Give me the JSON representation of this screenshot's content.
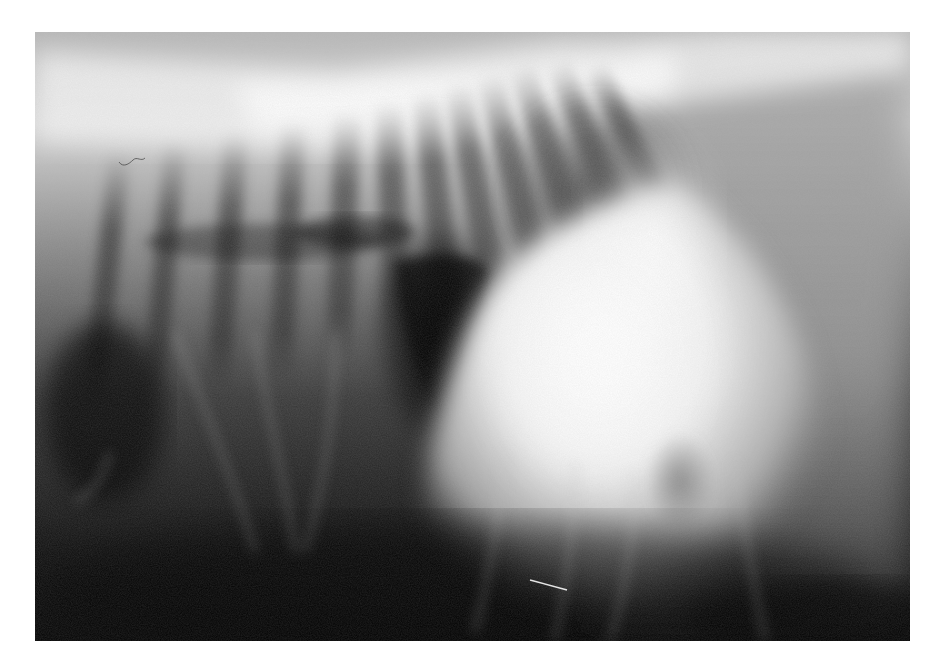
{
  "image": {
    "kind": "lateral thoracic radiograph",
    "palette": "grayscale",
    "frame": {
      "left": 35,
      "top": 32,
      "width": 875,
      "height": 609,
      "page_background": "#ffffff"
    },
    "regions": {
      "spine_band": {
        "tone": "#e8e8e8"
      },
      "lung_field": {
        "tone": "#3a3a3a"
      },
      "cardiac_silhouette": {
        "tone": "#f4f4f4"
      },
      "lower_abdomen": {
        "tone": "#0a0a0a"
      },
      "right_soft_tissue": {
        "tone": "#9a9a9a"
      }
    },
    "rib_count_visible": 14
  }
}
